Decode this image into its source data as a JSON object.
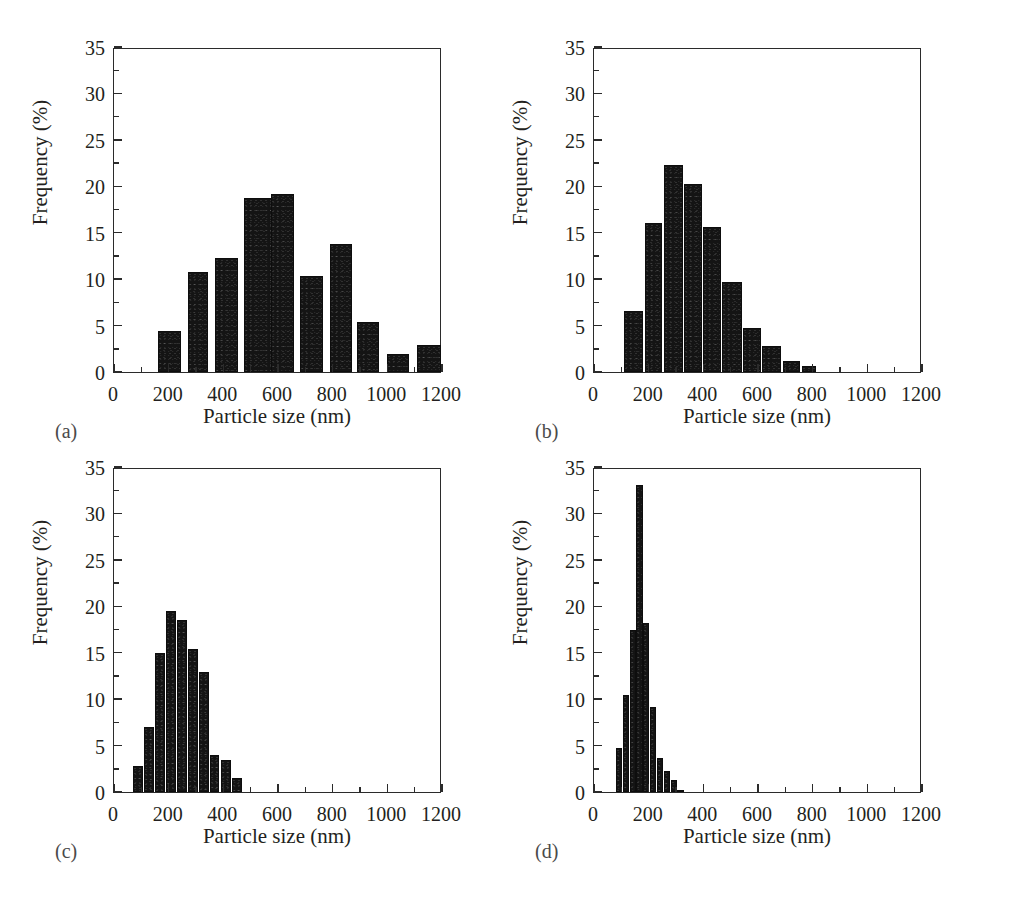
{
  "figure": {
    "background": "#ffffff",
    "bar_color": "#141414",
    "axis_color": "#2b2b2b",
    "panel_count": 4
  },
  "panels": [
    {
      "tag": "(a)",
      "xlabel": "Particle size (nm)",
      "ylabel": "Frequency (%)"
    },
    {
      "tag": "(b)",
      "xlabel": "Particle size (nm)",
      "ylabel": "Frequency (%)"
    },
    {
      "tag": "(c)",
      "xlabel": "Particle size (nm)",
      "ylabel": "Frequency (%)"
    },
    {
      "tag": "(d)",
      "xlabel": "Particle size (nm)",
      "ylabel": "Frequency (%)"
    }
  ],
  "axes": {
    "x_ticks": [
      "0",
      "200",
      "400",
      "600",
      "800",
      "1000",
      "1200"
    ],
    "x_tick_values": [
      0,
      200,
      400,
      600,
      800,
      1000,
      1200
    ],
    "x_minor_values": [
      100,
      300,
      500,
      700,
      900,
      1100
    ],
    "y_ticks": [
      "0",
      "5",
      "10",
      "15",
      "20",
      "25",
      "30",
      "35"
    ],
    "y_tick_values": [
      0,
      5,
      10,
      15,
      20,
      25,
      30,
      35
    ],
    "y_minor_values": [
      2.5,
      7.5,
      12.5,
      17.5,
      22.5,
      27.5,
      32.5
    ],
    "xlim": [
      0,
      1200
    ],
    "ylim": [
      0,
      35
    ]
  },
  "chart_data": [
    {
      "type": "bar",
      "panel": "(a)",
      "title": "",
      "xlabel": "Particle size (nm)",
      "ylabel": "Frequency (%)",
      "xlim": [
        0,
        1200
      ],
      "ylim": [
        0,
        35
      ],
      "grid": false,
      "legend": "none",
      "bin_width": 100,
      "bin_starts": [
        160,
        270,
        370,
        475,
        575,
        680,
        790,
        890,
        1000,
        1110
      ],
      "bin_ends": [
        245,
        345,
        455,
        660,
        660,
        765,
        870,
        970,
        1080,
        1195
      ],
      "categories": [
        "160-245",
        "270-345",
        "370-455",
        "475-560",
        "575-660",
        "680-765",
        "790-870",
        "890-970",
        "1000-1080",
        "1110-1195"
      ],
      "values": [
        4.4,
        10.8,
        12.3,
        18.7,
        19.2,
        10.3,
        13.8,
        5.4,
        1.9,
        2.9
      ]
    },
    {
      "type": "bar",
      "panel": "(b)",
      "title": "",
      "xlabel": "Particle size (nm)",
      "ylabel": "Frequency (%)",
      "xlim": [
        0,
        1200
      ],
      "ylim": [
        0,
        35
      ],
      "grid": false,
      "legend": "none",
      "bin_width": 70,
      "bin_starts": [
        110,
        185,
        255,
        330,
        400,
        470,
        545,
        615,
        690,
        760
      ],
      "bin_ends": [
        178,
        250,
        325,
        395,
        465,
        540,
        610,
        685,
        755,
        812
      ],
      "categories": [
        "110-178",
        "185-250",
        "255-325",
        "330-395",
        "400-465",
        "470-540",
        "545-610",
        "615-685",
        "690-755",
        "760-812"
      ],
      "values": [
        6.6,
        16.1,
        22.3,
        20.3,
        15.6,
        9.7,
        4.7,
        2.8,
        1.2,
        0.7
      ]
    },
    {
      "type": "bar",
      "panel": "(c)",
      "title": "",
      "xlabel": "Particle size (nm)",
      "ylabel": "Frequency (%)",
      "xlim": [
        0,
        1200
      ],
      "ylim": [
        0,
        35
      ],
      "grid": false,
      "legend": "none",
      "bin_width": 40,
      "bin_starts": [
        68,
        110,
        150,
        190,
        230,
        270,
        310,
        350,
        390,
        432
      ],
      "bin_ends": [
        105,
        146,
        186,
        226,
        266,
        306,
        346,
        386,
        427,
        468
      ],
      "categories": [
        "68-105",
        "110-146",
        "150-186",
        "190-226",
        "230-266",
        "270-306",
        "310-346",
        "350-386",
        "390-427",
        "432-468"
      ],
      "values": [
        2.8,
        7.0,
        15.0,
        19.5,
        18.5,
        15.4,
        12.9,
        4.0,
        3.5,
        1.5
      ]
    },
    {
      "type": "bar",
      "panel": "(d)",
      "title": "",
      "xlabel": "Particle size (nm)",
      "ylabel": "Frequency (%)",
      "xlim": [
        0,
        1200
      ],
      "ylim": [
        0,
        35
      ],
      "grid": false,
      "legend": "none",
      "bin_width": 25,
      "bin_starts": [
        80,
        105,
        130,
        155,
        180,
        205,
        230,
        255,
        280,
        305
      ],
      "bin_ends": [
        103,
        128,
        153,
        178,
        203,
        228,
        253,
        278,
        303,
        328
      ],
      "categories": [
        "80-103",
        "105-128",
        "130-153",
        "155-178",
        "180-203",
        "205-228",
        "230-253",
        "255-278",
        "280-303",
        "305-328"
      ],
      "values": [
        4.7,
        10.4,
        17.4,
        33.1,
        18.2,
        9.2,
        3.7,
        2.3,
        1.3,
        0.25
      ]
    }
  ]
}
